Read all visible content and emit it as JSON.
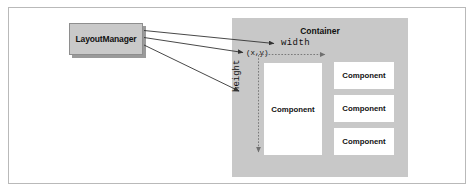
{
  "figure": {
    "type": "diagram",
    "background_color": "#ffffff",
    "frame_border_color": "#b9b9b9"
  },
  "layout_manager": {
    "label": "LayoutManager",
    "fill_color": "#c9c9c9",
    "border_color": "#8e8e8e",
    "shadow_color": "#9a9a9a"
  },
  "container": {
    "title": "Container",
    "fill_color": "#c8c8c8"
  },
  "components": {
    "main": {
      "label": "Component"
    },
    "stacked": [
      {
        "label": "Component"
      },
      {
        "label": "Component"
      },
      {
        "label": "Component"
      }
    ],
    "fill_color": "#ffffff"
  },
  "measurements": {
    "origin_label": "(x,y)",
    "width_label": "width",
    "height_label": "height",
    "guide_color": "#6f6f6f"
  },
  "arrows": {
    "color": "#333333",
    "count": 3,
    "from": "LayoutManager",
    "targets": [
      "width",
      "(x,y)",
      "height"
    ]
  }
}
